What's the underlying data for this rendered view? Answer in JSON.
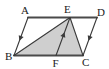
{
  "figure": {
    "kind": "geometry-diagram",
    "canvas": {
      "width": 109,
      "height": 69
    },
    "colors": {
      "stroke": "#3a3a3a",
      "thick_stroke": "#4a4a4a",
      "shade_fill": "#cfcfcf",
      "background": "#ffffff",
      "label": "#1a1a1a"
    },
    "points": {
      "A": {
        "label": "A",
        "x": 28.0,
        "y": 17.5,
        "label_x": 21.0,
        "label_y": 14.0
      },
      "B": {
        "label": "B",
        "x": 14.0,
        "y": 55.5,
        "label_x": 5.0,
        "label_y": 60.0
      },
      "C": {
        "label": "C",
        "x": 83.0,
        "y": 55.5,
        "label_x": 82.0,
        "label_y": 65.5
      },
      "D": {
        "label": "D",
        "x": 97.0,
        "y": 17.5,
        "label_x": 97.0,
        "label_y": 15.5
      },
      "E": {
        "label": "E",
        "x": 70.0,
        "y": 17.5,
        "label_x": 64.0,
        "label_y": 12.5
      },
      "F": {
        "label": "F",
        "x": 56.0,
        "y": 55.5,
        "label_x": 52.5,
        "label_y": 67.0
      }
    },
    "segments": [
      {
        "name": "side-AD",
        "from": "A",
        "to": "D",
        "style": "thick"
      },
      {
        "name": "side-BC",
        "from": "B",
        "to": "C",
        "style": "thick"
      },
      {
        "name": "side-AB",
        "from": "A",
        "to": "B",
        "style": "thin"
      },
      {
        "name": "side-DC",
        "from": "D",
        "to": "C",
        "style": "thin"
      },
      {
        "name": "segment-BE",
        "from": "B",
        "to": "E",
        "style": "thin"
      },
      {
        "name": "segment-EC",
        "from": "E",
        "to": "C",
        "style": "thin"
      },
      {
        "name": "segment-EF",
        "from": "E",
        "to": "F",
        "style": "thin"
      }
    ],
    "shaded_region": {
      "name": "triangle-BEC",
      "vertices": [
        "B",
        "E",
        "C"
      ]
    },
    "arrow_marks": [
      {
        "name": "arrow-on-AB",
        "on": "side-AB",
        "t": 0.55,
        "direction": "toward-B"
      },
      {
        "name": "arrow-on-DC",
        "on": "side-DC",
        "t": 0.55,
        "direction": "toward-C"
      },
      {
        "name": "arrow-on-EF",
        "on": "segment-EF",
        "t": 0.45,
        "direction": "toward-E"
      }
    ],
    "labels_text": {
      "A": "A",
      "B": "B",
      "C": "C",
      "D": "D",
      "E": "E",
      "F": "F"
    }
  }
}
